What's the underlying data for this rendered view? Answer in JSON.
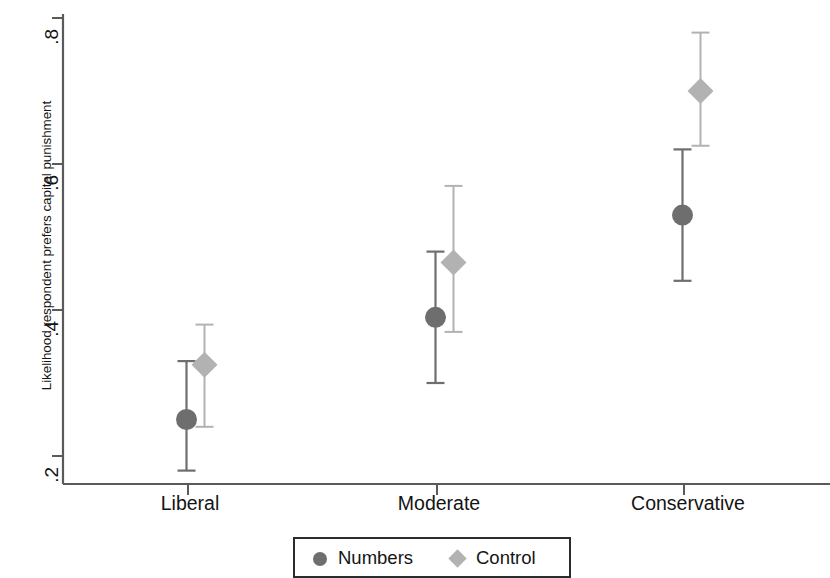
{
  "chart_data": {
    "type": "scatter",
    "title": "",
    "xlabel": "",
    "ylabel": "Likelihood respondent prefers capital punishment",
    "categories": [
      "Liberal",
      "Moderate",
      "Conservative"
    ],
    "ylim": [
      0.155,
      0.815
    ],
    "yticks": [
      0.2,
      0.4,
      0.6,
      0.8
    ],
    "ytick_labels": [
      ".2",
      ".4",
      ".6",
      ".8"
    ],
    "grid": false,
    "legend_position": "bottom-center",
    "error_bars": "vertical capped confidence intervals",
    "series": [
      {
        "name": "Numbers",
        "marker": "circle",
        "color": "#6e6e6e",
        "values": [
          0.25,
          0.39,
          0.53
        ],
        "ci_low": [
          0.18,
          0.3,
          0.44
        ],
        "ci_high": [
          0.33,
          0.48,
          0.62
        ]
      },
      {
        "name": "Control",
        "marker": "diamond",
        "color": "#b2b2b2",
        "values": [
          0.325,
          0.465,
          0.7
        ],
        "ci_low": [
          0.24,
          0.37,
          0.625
        ],
        "ci_high": [
          0.38,
          0.57,
          0.78
        ]
      }
    ]
  },
  "axes": {
    "y_axis_label": "Likelihood respondent prefers capital punishment",
    "y_tick_labels": [
      ".8",
      ".6",
      ".4",
      ".2"
    ],
    "x_tick_labels": [
      "Liberal",
      "Moderate",
      "Conservative"
    ]
  },
  "legend": {
    "entries": [
      {
        "label": "Numbers",
        "marker": "circle-marker-icon",
        "color": "#6e6e6e"
      },
      {
        "label": "Control",
        "marker": "diamond-marker-icon",
        "color": "#b2b2b2"
      }
    ]
  }
}
